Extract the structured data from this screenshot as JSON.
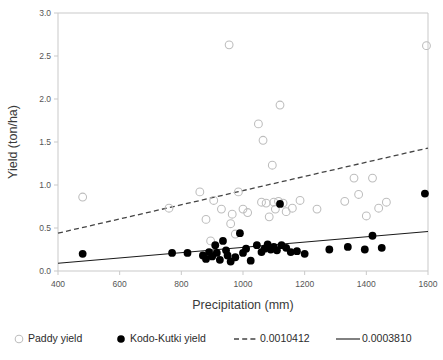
{
  "chart_data": {
    "type": "scatter",
    "title": "",
    "xlabel": "Precipitation (mm)",
    "ylabel": "Yield (ton/ha)",
    "xlim": [
      400,
      1600
    ],
    "ylim": [
      0.0,
      3.0
    ],
    "xticks": [
      400,
      600,
      800,
      1000,
      1200,
      1400,
      1600
    ],
    "yticks": [
      "0.0",
      "0.5",
      "1.0",
      "1.5",
      "2.0",
      "2.5",
      "3.0"
    ],
    "grid": false,
    "legend_position": "bottom",
    "series": [
      {
        "name": "Paddy yield",
        "marker": "open-circle",
        "color": "#bdbdbd",
        "points": [
          [
            480,
            0.86
          ],
          [
            760,
            0.73
          ],
          [
            860,
            0.92
          ],
          [
            880,
            0.6
          ],
          [
            895,
            0.35
          ],
          [
            905,
            0.82
          ],
          [
            930,
            0.72
          ],
          [
            955,
            2.63
          ],
          [
            960,
            0.55
          ],
          [
            965,
            0.66
          ],
          [
            975,
            0.43
          ],
          [
            985,
            0.92
          ],
          [
            1000,
            0.72
          ],
          [
            1015,
            0.68
          ],
          [
            1050,
            1.71
          ],
          [
            1060,
            0.8
          ],
          [
            1065,
            1.52
          ],
          [
            1075,
            0.79
          ],
          [
            1085,
            0.63
          ],
          [
            1095,
            1.23
          ],
          [
            1100,
            0.8
          ],
          [
            1105,
            0.72
          ],
          [
            1115,
            0.81
          ],
          [
            1120,
            1.93
          ],
          [
            1130,
            0.79
          ],
          [
            1140,
            0.69
          ],
          [
            1160,
            0.73
          ],
          [
            1185,
            0.82
          ],
          [
            1240,
            0.72
          ],
          [
            1330,
            0.81
          ],
          [
            1360,
            1.08
          ],
          [
            1375,
            0.89
          ],
          [
            1400,
            0.64
          ],
          [
            1420,
            1.08
          ],
          [
            1440,
            0.73
          ],
          [
            1465,
            0.8
          ],
          [
            1595,
            2.62
          ]
        ]
      },
      {
        "name": "Kodo-Kutki yield",
        "marker": "filled-circle",
        "color": "#000000",
        "points": [
          [
            480,
            0.2
          ],
          [
            770,
            0.21
          ],
          [
            820,
            0.21
          ],
          [
            870,
            0.18
          ],
          [
            880,
            0.14
          ],
          [
            890,
            0.22
          ],
          [
            900,
            0.17
          ],
          [
            910,
            0.3
          ],
          [
            915,
            0.21
          ],
          [
            925,
            0.13
          ],
          [
            935,
            0.35
          ],
          [
            945,
            0.24
          ],
          [
            950,
            0.18
          ],
          [
            960,
            0.11
          ],
          [
            975,
            0.16
          ],
          [
            990,
            0.44
          ],
          [
            1000,
            0.21
          ],
          [
            1010,
            0.26
          ],
          [
            1025,
            0.12
          ],
          [
            1045,
            0.3
          ],
          [
            1060,
            0.22
          ],
          [
            1070,
            0.26
          ],
          [
            1080,
            0.31
          ],
          [
            1090,
            0.25
          ],
          [
            1100,
            0.28
          ],
          [
            1110,
            0.24
          ],
          [
            1120,
            0.78
          ],
          [
            1125,
            0.3
          ],
          [
            1140,
            0.27
          ],
          [
            1155,
            0.22
          ],
          [
            1175,
            0.23
          ],
          [
            1200,
            0.2
          ],
          [
            1280,
            0.25
          ],
          [
            1340,
            0.28
          ],
          [
            1395,
            0.25
          ],
          [
            1420,
            0.41
          ],
          [
            1450,
            0.27
          ],
          [
            1590,
            0.9
          ]
        ]
      }
    ],
    "trendlines": [
      {
        "name": "0.0010412",
        "style": "dashed",
        "for_series": "Paddy yield",
        "slope": 0.0010412,
        "x_start": 400,
        "y_start": 0.44,
        "x_end": 1600,
        "y_end": 1.43
      },
      {
        "name": "0.0003810",
        "style": "solid",
        "for_series": "Kodo-Kutki yield",
        "slope": 0.000381,
        "x_start": 400,
        "y_start": 0.09,
        "x_end": 1600,
        "y_end": 0.46
      }
    ]
  },
  "legend": {
    "items": [
      {
        "label": "Paddy yield",
        "marker": "open-circle"
      },
      {
        "label": "Kodo-Kutki yield",
        "marker": "filled-circle"
      },
      {
        "label": "0.0010412",
        "marker": "dashed-line"
      },
      {
        "label": "0.0003810",
        "marker": "solid-line"
      }
    ]
  }
}
